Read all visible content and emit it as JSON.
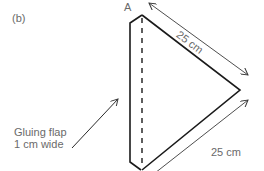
{
  "figure": {
    "label": "(b)",
    "point_label": "A",
    "dimensions": {
      "top_edge": "25 cm",
      "bottom_edge": "25 cm"
    },
    "annotation": {
      "line1": "Gluing flap",
      "line2": "1 cm wide"
    },
    "colors": {
      "outline": "#1a1a1a",
      "dimension_lines": "#3a3a3a",
      "text": "#6a6a6a"
    }
  }
}
